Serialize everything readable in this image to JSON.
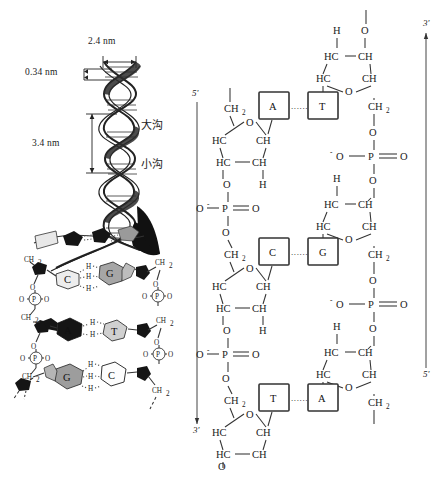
{
  "figure": {
    "title_absent": true,
    "panels": [
      "dna-double-helix-schematic",
      "dna-chemical-structure"
    ]
  },
  "helix": {
    "dim_width": "2.4 nm",
    "dim_rise": "0.34 nm",
    "dim_pitch": "3.4 nm",
    "groove_major": "大沟",
    "groove_minor": "小沟"
  },
  "ladder": {
    "pairs": [
      {
        "left": "C",
        "right": "G",
        "hbonds": 3,
        "hbond_label": "H"
      },
      {
        "left": "A",
        "right": "T",
        "hbonds": 2,
        "hbond_label": "H"
      },
      {
        "left": "G",
        "right": "C",
        "hbonds": 3,
        "hbond_label": "H"
      }
    ],
    "sugar_label": "CH",
    "sugar_sub": "2",
    "phosphate_label": "P",
    "oxygen_label": "O"
  },
  "chem": {
    "left_strand": {
      "top_prime": "5'",
      "bottom_prime": "3'",
      "direction": "5-to-3-downward"
    },
    "right_strand": {
      "top_prime": "3'",
      "bottom_prime": "5'",
      "direction": "3-to-5-downward"
    },
    "base_pairs": [
      {
        "left": "A",
        "right": "T",
        "link": "......"
      },
      {
        "left": "C",
        "right": "G",
        "link": "......"
      },
      {
        "left": "T",
        "right": "A",
        "link": "......"
      }
    ],
    "atoms": {
      "ch2": "CH",
      "ch2_sub": "2",
      "o": "O",
      "o_minus": "⁻O",
      "p": "P",
      "hc": "HC",
      "ch": "CH",
      "h": "H"
    }
  },
  "colors": {
    "ink": "#222222",
    "paper": "#ffffff",
    "bond": "#333333",
    "hbond": "#555555"
  }
}
